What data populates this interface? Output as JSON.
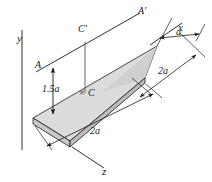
{
  "figure": {
    "type": "engineering-mechanics-diagram",
    "colors": {
      "line": "#1a1a1a",
      "top_face": "#d9d9d9",
      "top_face_light": "#e8e8e8",
      "edge_face": "#c4c4c4",
      "background": "#ffffff"
    }
  },
  "axes": {
    "y_label": "y",
    "x_label": "x",
    "z_label": "z"
  },
  "points": {
    "a_label": "A",
    "a_prime_label": "A'",
    "c_label": "C",
    "c_prime_label": "C'",
    "c_marker": "×"
  },
  "dimensions": {
    "height": "1.5a",
    "top_right": "a",
    "right_side": "2a",
    "bottom_left": "2a"
  }
}
